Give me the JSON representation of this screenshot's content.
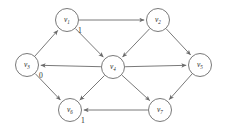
{
  "diagram": {
    "type": "directed-graph",
    "canvas": {
      "width": 226,
      "height": 128,
      "background": "#ffffff"
    },
    "style": {
      "stroke_color": "#6a6a6a",
      "node_fill": "#ffffff",
      "text_color": "#2b2b2b",
      "node_radius": 11.5
    },
    "nodes": [
      {
        "id": "v1",
        "base": "v",
        "sub": "1",
        "x": 67,
        "y": 20,
        "label": "v1"
      },
      {
        "id": "v2",
        "base": "v",
        "sub": "2",
        "x": 158,
        "y": 20,
        "label": "v2"
      },
      {
        "id": "v3",
        "base": "v",
        "sub": "3",
        "x": 27,
        "y": 65,
        "label": "v3"
      },
      {
        "id": "v4",
        "base": "v",
        "sub": "4",
        "x": 113,
        "y": 67,
        "label": "v4"
      },
      {
        "id": "v5",
        "base": "v",
        "sub": "5",
        "x": 200,
        "y": 65,
        "label": "v5"
      },
      {
        "id": "v6",
        "base": "v",
        "sub": "6",
        "x": 70,
        "y": 110,
        "label": "v6"
      },
      {
        "id": "v7",
        "base": "v",
        "sub": "7",
        "x": 160,
        "y": 110,
        "label": "v7"
      }
    ],
    "edges": [
      {
        "from": "v3",
        "to": "v1",
        "directed": true,
        "label": ""
      },
      {
        "from": "v1",
        "to": "v2",
        "directed": true,
        "label": "1"
      },
      {
        "from": "v1",
        "to": "v4",
        "directed": true,
        "label": ""
      },
      {
        "from": "v2",
        "to": "v4",
        "directed": true,
        "label": ""
      },
      {
        "from": "v2",
        "to": "v5",
        "directed": true,
        "label": ""
      },
      {
        "from": "v4",
        "to": "v3",
        "directed": true,
        "label": "0"
      },
      {
        "from": "v4",
        "to": "v5",
        "directed": true,
        "label": ""
      },
      {
        "from": "v3",
        "to": "v6",
        "directed": true,
        "label": ""
      },
      {
        "from": "v4",
        "to": "v6",
        "directed": true,
        "label": ""
      },
      {
        "from": "v4",
        "to": "v7",
        "directed": true,
        "label": ""
      },
      {
        "from": "v5",
        "to": "v7",
        "directed": true,
        "label": ""
      },
      {
        "from": "v7",
        "to": "v6",
        "directed": true,
        "label": "1"
      }
    ],
    "edge_labels": [
      {
        "text": "1",
        "x": 80,
        "y": 31,
        "for_edge": "v1-v2"
      },
      {
        "text": "0",
        "x": 41,
        "y": 76,
        "for_edge": "v4-v3"
      },
      {
        "text": "1",
        "x": 83,
        "y": 121,
        "for_edge": "v7-v6"
      }
    ]
  }
}
